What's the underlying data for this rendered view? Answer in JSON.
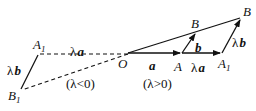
{
  "diagram": {
    "points": {
      "O": "O",
      "A": "A",
      "A1_right": "A",
      "A1_right_sub": "1",
      "B_mid": "B",
      "B_far": "B",
      "A1_left": "A",
      "A1_left_sub": "1",
      "B1_left": "B",
      "B1_left_sub": "1"
    },
    "vectors": {
      "a": "a",
      "b": "b",
      "lambda": "λ",
      "lambda_a_right": "a",
      "lambda_b_right": "b",
      "lambda_a_left": "a",
      "lambda_b_left": "b"
    },
    "captions": {
      "negative": "(λ<0)",
      "positive": "(λ>0)"
    },
    "colors": {
      "ink": "#111111",
      "background": "#ffffff"
    }
  }
}
